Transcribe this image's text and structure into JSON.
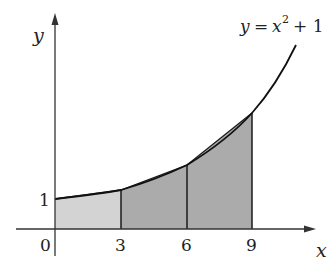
{
  "figure": {
    "type": "trapezoidal-rule-diagram",
    "function_label": "y = x² + 1",
    "function_label_parts": {
      "lhs": "y",
      "eq": "=",
      "var": "x",
      "exp": "2",
      "rest": "+ 1"
    },
    "axes": {
      "x_label": "x",
      "y_label": "y",
      "x_ticks": [
        "0",
        "3",
        "6",
        "9"
      ],
      "y_ticks": [
        "1"
      ]
    },
    "trapezoids": [
      {
        "from": "0",
        "to": "3",
        "shade": "light"
      },
      {
        "from": "3",
        "to": "6",
        "shade": "dark"
      },
      {
        "from": "6",
        "to": "9",
        "shade": "dark"
      }
    ],
    "colors": {
      "light_fill": "#d3d3d3",
      "dark_fill": "#ababab",
      "stroke": "#1a1a1a",
      "axis": "#333333"
    }
  }
}
